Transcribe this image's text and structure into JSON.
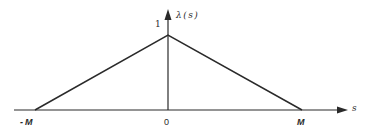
{
  "diagram": {
    "type": "triangular-window-function",
    "y_axis": {
      "label": "λ(s)",
      "peak_value_label": "1"
    },
    "x_axis": {
      "label": "s",
      "ticks": [
        {
          "label": "-M",
          "position": "left-end"
        },
        {
          "label": "0",
          "position": "origin"
        },
        {
          "label": "M",
          "position": "right-end"
        }
      ]
    },
    "curve": {
      "shape": "triangle",
      "points": [
        {
          "s": "-M",
          "value": 0
        },
        {
          "s": "0",
          "value": 1
        },
        {
          "s": "M",
          "value": 0
        }
      ]
    },
    "colors": {
      "line": "#2a2a2a",
      "background": "#ffffff"
    }
  }
}
